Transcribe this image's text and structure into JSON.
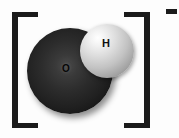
{
  "figure": {
    "kind": "space-filling-molecular-model",
    "species_name": "hydroxide ion",
    "formula": "OH",
    "overall_charge": "-1",
    "charge_symbol": "−",
    "background_color": "#fdfdfd",
    "bracket_color": "#1b1b1b"
  },
  "brackets": {
    "left_label": "[",
    "right_label": "]",
    "meaning": "encloses polyatomic ion"
  },
  "charge": {
    "symbol": "−",
    "label": "minus",
    "value": -1,
    "position": "superscript-right"
  },
  "atoms": [
    {
      "id": "oxygen",
      "label": "O",
      "element": "Oxygen",
      "render_color": "#2c2c2c",
      "label_color": "#070707",
      "relative_size": "large"
    },
    {
      "id": "hydrogen",
      "label": "H",
      "element": "Hydrogen",
      "render_color": "#dcdcdc",
      "label_color": "#101010",
      "relative_size": "small"
    }
  ]
}
